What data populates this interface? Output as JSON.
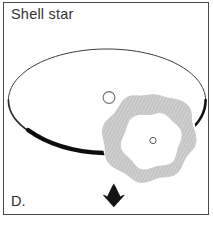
{
  "panel": {
    "title": "Shell star",
    "letter": "D.",
    "frame_color": "#4a4a4a",
    "background_color": "#ffffff",
    "text_color": "#333333"
  },
  "diagram": {
    "type": "astronomy-schematic",
    "elements": [
      {
        "name": "disk-ellipse",
        "label": "circumstellar disk",
        "shape": "ellipse",
        "center_x": 107,
        "center_y": 96,
        "radius_x": 99,
        "radius_y": 48,
        "stroke_color": "#111111",
        "stroke_thin": 0.9,
        "stroke_thick": 4.2
      },
      {
        "name": "shell-ring",
        "label": "expanding shell",
        "shape": "scalloped-annulus",
        "center_x": 150,
        "center_y": 141,
        "outer_radius": 46,
        "inner_radius": 27,
        "lobes": 11,
        "fill_color": "#c9c9c9",
        "hatch_color": "#b5b5b5"
      },
      {
        "name": "central-star",
        "label": "star",
        "shape": "circle-outline",
        "center_x": 153,
        "center_y": 140,
        "radius": 3.2,
        "stroke_color": "#555555"
      },
      {
        "name": "companion-point",
        "label": "companion",
        "shape": "circle-outline",
        "center_x": 109,
        "center_y": 98,
        "radius": 6,
        "stroke_color": "#6b6b6b"
      },
      {
        "name": "motion-arrow",
        "label": "direction of motion",
        "shape": "arrow-down",
        "tip_x": 114,
        "tip_y": 205,
        "color": "#141414"
      }
    ]
  }
}
